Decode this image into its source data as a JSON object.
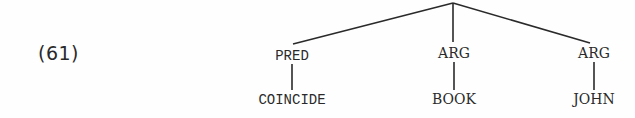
{
  "example": {
    "number": "(61)"
  },
  "tree": {
    "root": {
      "label": "",
      "x": 453,
      "y": 3
    },
    "children": [
      {
        "label": "PRED",
        "x": 292,
        "y": 48,
        "leaf": {
          "label": "COINCIDE",
          "x": 292,
          "y": 92
        }
      },
      {
        "label": "ARG",
        "x": 454,
        "y": 46,
        "leaf": {
          "label": "BOOK",
          "x": 454,
          "y": 92
        }
      },
      {
        "label": "ARG",
        "x": 593,
        "y": 46,
        "leaf": {
          "label": "JOHN",
          "x": 593,
          "y": 92
        }
      }
    ]
  }
}
